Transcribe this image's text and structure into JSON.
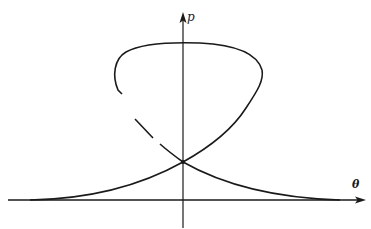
{
  "diagram": {
    "type": "phase-portrait",
    "axes": {
      "vertical": {
        "label": "p",
        "arrow": true
      },
      "horizontal": {
        "label": "θ",
        "arrow": true
      }
    },
    "colors": {
      "stroke": "#1a1a1a",
      "background": "#ffffff"
    }
  }
}
